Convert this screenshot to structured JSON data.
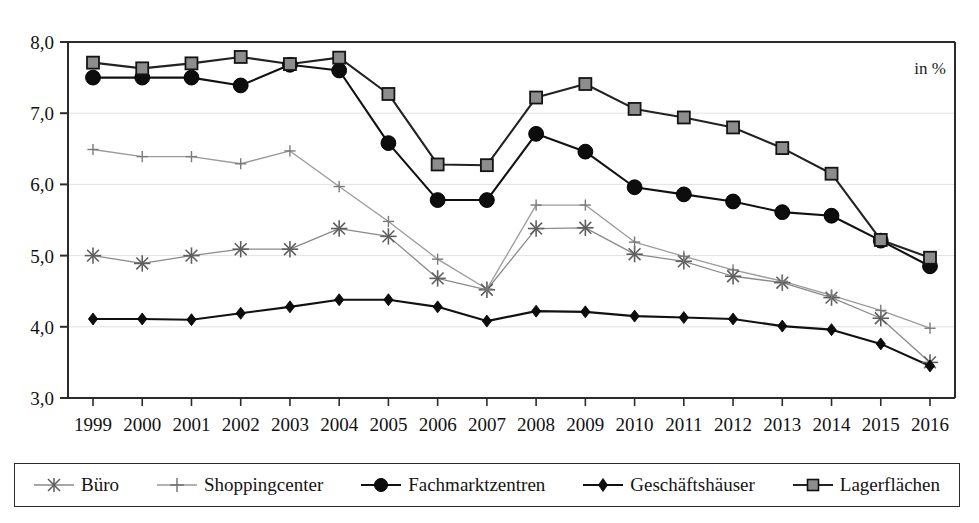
{
  "chart_data": {
    "type": "line",
    "title": "",
    "subtitle": "",
    "xlabel": "",
    "ylabel": "",
    "unit_note": "in %",
    "grid": true,
    "legend_position": "bottom",
    "x": [
      "1999",
      "2000",
      "2001",
      "2002",
      "2003",
      "2004",
      "2005",
      "2006",
      "2007",
      "2008",
      "2009",
      "2010",
      "2011",
      "2012",
      "2013",
      "2014",
      "2015",
      "2016"
    ],
    "categories": [
      "1999",
      "2000",
      "2001",
      "2002",
      "2003",
      "2004",
      "2005",
      "2006",
      "2007",
      "2008",
      "2009",
      "2010",
      "2011",
      "2012",
      "2013",
      "2014",
      "2015",
      "2016"
    ],
    "yticks": [
      "3,0",
      "4,0",
      "5,0",
      "6,0",
      "7,0",
      "8,0"
    ],
    "ytick_values": [
      3.0,
      4.0,
      5.0,
      6.0,
      7.0,
      8.0
    ],
    "ylim": [
      3.0,
      8.0
    ],
    "series": [
      {
        "name": "Büro",
        "marker": "asterisk",
        "color": "#8a8a8a",
        "values": [
          5.0,
          4.89,
          5.0,
          5.09,
          5.09,
          5.38,
          5.27,
          4.68,
          4.52,
          5.38,
          5.39,
          5.02,
          4.92,
          4.71,
          4.62,
          4.41,
          4.12,
          3.5
        ]
      },
      {
        "name": "Shoppingcenter",
        "marker": "plus",
        "color": "#9a9a9a",
        "values": [
          6.49,
          6.39,
          6.39,
          6.29,
          6.47,
          5.97,
          5.48,
          4.95,
          4.53,
          5.71,
          5.71,
          5.19,
          4.99,
          4.8,
          4.64,
          4.44,
          4.23,
          3.98
        ]
      },
      {
        "name": "Fachmarktzentren",
        "marker": "circle",
        "color": "#111111",
        "values": [
          7.5,
          7.5,
          7.5,
          7.39,
          7.68,
          7.6,
          6.58,
          5.78,
          5.78,
          6.71,
          6.46,
          5.96,
          5.86,
          5.76,
          5.61,
          5.56,
          5.21,
          4.85
        ]
      },
      {
        "name": "Geschäftshäuser",
        "marker": "diamond",
        "color": "#111111",
        "values": [
          4.11,
          4.11,
          4.1,
          4.19,
          4.28,
          4.38,
          4.38,
          4.28,
          4.08,
          4.22,
          4.21,
          4.15,
          4.13,
          4.11,
          4.01,
          3.96,
          3.76,
          3.45
        ]
      },
      {
        "name": "Lagerflächen",
        "marker": "square",
        "color": "#222222",
        "values": [
          7.71,
          7.63,
          7.7,
          7.79,
          7.69,
          7.78,
          7.27,
          6.28,
          6.27,
          7.22,
          7.41,
          7.06,
          6.94,
          6.8,
          6.51,
          6.15,
          5.22,
          4.97
        ]
      }
    ]
  },
  "legend": {
    "items": [
      {
        "label": "Büro",
        "marker": "asterisk",
        "color": "#8a8a8a"
      },
      {
        "label": "Shoppingcenter",
        "marker": "plus",
        "color": "#9a9a9a"
      },
      {
        "label": "Fachmarktzentren",
        "marker": "circle",
        "color": "#111111"
      },
      {
        "label": "Geschäftshäuser",
        "marker": "diamond",
        "color": "#111111"
      },
      {
        "label": "Lagerflächen",
        "marker": "square",
        "color": "#222222"
      }
    ]
  },
  "colors": {
    "axis": "#2b2b2b",
    "grid": "#e2e2e2",
    "background": "#ffffff",
    "text": "#141414"
  }
}
